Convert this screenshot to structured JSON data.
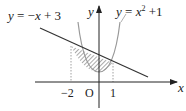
{
  "figure": {
    "line_label": "y = −x + 3",
    "line_label_parts": {
      "y": "y",
      "eq": " = −",
      "x": "x",
      "rest": " + 3"
    },
    "parabola_label_parts": {
      "y": "y",
      "eq": " = ",
      "x": "x",
      "sup": "2",
      "rest": " +1"
    },
    "axis_x_label": "x",
    "axis_y_label": "y",
    "origin_label": "O",
    "tick_neg2": "−2",
    "tick_1": "1",
    "colors": {
      "stroke": "#333333",
      "curve": "#999999",
      "hatch": "#555555",
      "dotted": "#888888"
    }
  }
}
